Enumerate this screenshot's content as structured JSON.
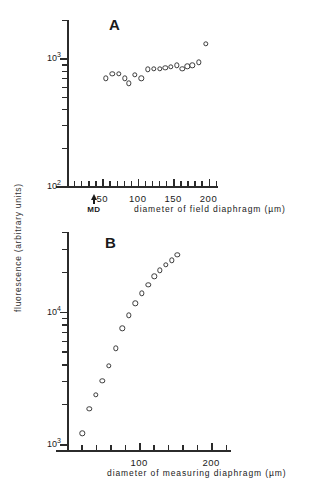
{
  "figure": {
    "y_axis_label": "fluorescence (arbitrary units)"
  },
  "chart_data": [
    {
      "type": "scatter",
      "panel": "A",
      "title": "A",
      "xlabel": "diameter of field diaphragm  (µm)",
      "ylabel": "fluorescence (arbitrary units)",
      "yscale": "log",
      "xlim": [
        0,
        212
      ],
      "ylim": [
        100,
        2000
      ],
      "xticks_major": [
        50,
        100,
        150,
        200
      ],
      "xticks_minor": [
        10,
        20,
        30,
        40,
        60,
        70,
        80,
        90,
        110,
        120,
        130,
        140,
        160,
        170,
        180,
        190,
        210
      ],
      "ytick_labels": [
        "10³",
        "10²"
      ],
      "ytick_values": [
        1000,
        100
      ],
      "grid": false,
      "legend": null,
      "annotations": [
        {
          "label": "MD",
          "x": 38,
          "type": "arrow-up",
          "axis": "x"
        }
      ],
      "points": [
        {
          "x": 55,
          "y": 700
        },
        {
          "x": 64,
          "y": 760
        },
        {
          "x": 73,
          "y": 760
        },
        {
          "x": 82,
          "y": 700
        },
        {
          "x": 87,
          "y": 640
        },
        {
          "x": 96,
          "y": 745
        },
        {
          "x": 105,
          "y": 700
        },
        {
          "x": 114,
          "y": 820
        },
        {
          "x": 123,
          "y": 830
        },
        {
          "x": 131,
          "y": 830
        },
        {
          "x": 139,
          "y": 840
        },
        {
          "x": 147,
          "y": 860
        },
        {
          "x": 155,
          "y": 880
        },
        {
          "x": 163,
          "y": 830
        },
        {
          "x": 170,
          "y": 870
        },
        {
          "x": 177,
          "y": 880
        },
        {
          "x": 186,
          "y": 930
        },
        {
          "x": 196,
          "y": 1300
        }
      ]
    },
    {
      "type": "scatter",
      "panel": "B",
      "title": "B",
      "xlabel": "diameter of measuring diaphragm (µm)",
      "ylabel": "fluorescence (arbitrary units)",
      "yscale": "log",
      "xlim": [
        0,
        222
      ],
      "ylim": [
        900,
        40000
      ],
      "xticks_major": [
        100,
        200
      ],
      "xticks_minor": [
        20,
        40,
        60,
        80,
        120,
        140,
        160,
        180,
        220
      ],
      "ytick_labels": [
        "10⁴",
        "10³"
      ],
      "ytick_values": [
        10000,
        1000
      ],
      "grid": false,
      "legend": null,
      "annotations": [],
      "points": [
        {
          "x": 21,
          "y": 1200
        },
        {
          "x": 31,
          "y": 1850
        },
        {
          "x": 40,
          "y": 2350
        },
        {
          "x": 49,
          "y": 3000
        },
        {
          "x": 58,
          "y": 3900
        },
        {
          "x": 68,
          "y": 5300
        },
        {
          "x": 77,
          "y": 7500
        },
        {
          "x": 86,
          "y": 9400
        },
        {
          "x": 95,
          "y": 11600
        },
        {
          "x": 104,
          "y": 13800
        },
        {
          "x": 113,
          "y": 16000
        },
        {
          "x": 121,
          "y": 18500
        },
        {
          "x": 129,
          "y": 20500
        },
        {
          "x": 137,
          "y": 22500
        },
        {
          "x": 145,
          "y": 24500
        },
        {
          "x": 153,
          "y": 27000
        }
      ]
    }
  ]
}
